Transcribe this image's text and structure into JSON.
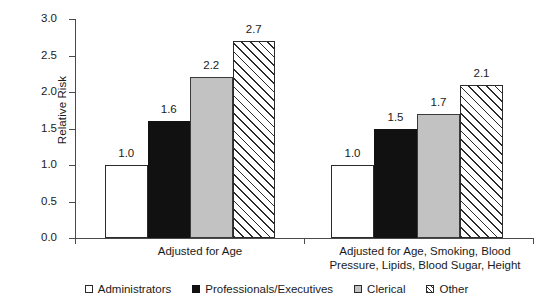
{
  "chart_data": {
    "type": "bar",
    "title": "",
    "xlabel": "",
    "ylabel": "Relative Risk",
    "ylim": [
      0.0,
      3.0
    ],
    "ytick_values": [
      0.0,
      0.5,
      1.0,
      1.5,
      2.0,
      2.5,
      3.0
    ],
    "ytick_labels": [
      "0.0",
      "0.5",
      "1.0",
      "1.5",
      "2.0",
      "2.5",
      "3.0"
    ],
    "grid": false,
    "legend_position": "bottom",
    "categories": [
      "Adjusted for Age",
      "Adjusted for Age, Smoking, Blood Pressure, Lipids, Blood Sugar, Height"
    ],
    "category_label_lines": [
      [
        "Adjusted for Age"
      ],
      [
        "Adjusted for Age, Smoking, Blood",
        "Pressure, Lipids, Blood Sugar, Height"
      ]
    ],
    "series": [
      {
        "name": "Administrators",
        "fill": "white",
        "values": [
          1.0,
          1.0
        ],
        "labels": [
          "1.0",
          "1.0"
        ]
      },
      {
        "name": "Professionals/Executives",
        "fill": "black",
        "values": [
          1.6,
          1.5
        ],
        "labels": [
          "1.6",
          "1.5"
        ]
      },
      {
        "name": "Clerical",
        "fill": "gray",
        "values": [
          2.2,
          1.7
        ],
        "labels": [
          "2.2",
          "1.7"
        ]
      },
      {
        "name": "Other",
        "fill": "hatch",
        "values": [
          2.7,
          2.1
        ],
        "labels": [
          "2.7",
          "2.1"
        ]
      }
    ],
    "colors": {
      "white": "#ffffff",
      "black": "#111111",
      "gray": "#c2c2c2",
      "hatch_line": "#2b2b2b",
      "axis": "#4a4a4a",
      "text": "#1a1a1a",
      "background": "#ffffff"
    }
  },
  "legend": {
    "items": [
      {
        "label": "Administrators",
        "swatch": "open-square-swatch"
      },
      {
        "label": "Professionals/Executives",
        "swatch": "filled-square-swatch"
      },
      {
        "label": "Clerical",
        "swatch": "gray-square-swatch"
      },
      {
        "label": "Other",
        "swatch": "hatched-square-swatch"
      }
    ]
  }
}
